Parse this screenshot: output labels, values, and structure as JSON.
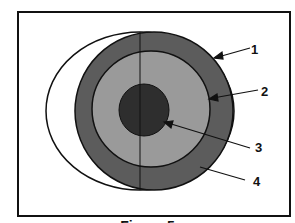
{
  "figure": {
    "caption": "Figure 5",
    "labels": [
      {
        "id": 1,
        "text": "1"
      },
      {
        "id": 2,
        "text": "2"
      },
      {
        "id": 3,
        "text": "3"
      },
      {
        "id": 4,
        "text": "4"
      }
    ],
    "colors": {
      "outer_ring": "#5c5c5c",
      "middle_ring": "#9a9a9a",
      "core": "#2e2e2e",
      "crescent": "#ffffff",
      "stroke": "#111111"
    }
  }
}
